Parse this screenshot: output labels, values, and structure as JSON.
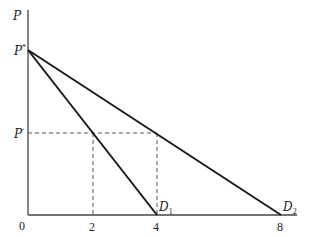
{
  "diagram": {
    "type": "demand-curves",
    "axes": {
      "y_label": "P",
      "origin_label": "0",
      "x_ticks": [
        {
          "label": "2",
          "x": 93
        },
        {
          "label": "4",
          "x": 157
        },
        {
          "label": "8",
          "x": 281
        }
      ],
      "y_ticks": [
        {
          "label": "P*",
          "main": "P",
          "sup": "*",
          "y": 50
        },
        {
          "label": "P'",
          "main": "P",
          "sup": "′",
          "y": 133
        }
      ]
    },
    "curves": [
      {
        "name": "D1",
        "main": "D",
        "sub": "1",
        "from": "P*",
        "to_x_value": 4
      },
      {
        "name": "D2",
        "main": "D",
        "sub": "2",
        "from": "P*",
        "to_x_value": 8
      }
    ],
    "guides": {
      "horizontal_at": "P'",
      "vertical_at": [
        "2",
        "4"
      ]
    },
    "colors": {
      "line": "#1a1a1a",
      "axis": "#444444",
      "dashed": "#555555"
    }
  }
}
